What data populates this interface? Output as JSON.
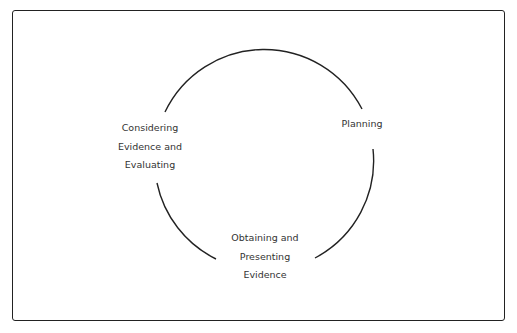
{
  "diagram": {
    "type": "cycle",
    "stages": [
      {
        "id": "planning",
        "label": "Planning",
        "lines": [
          "Planning"
        ]
      },
      {
        "id": "obtaining",
        "label": "Obtaining and Presenting Evidence",
        "lines": [
          "Obtaining and",
          "Presenting",
          "Evidence"
        ]
      },
      {
        "id": "considering",
        "label": "Considering Evidence and Evaluating",
        "lines": [
          "Considering",
          "Evidence and",
          "Evaluating"
        ]
      }
    ],
    "line_color": "#222222",
    "text_color": "#333333"
  }
}
